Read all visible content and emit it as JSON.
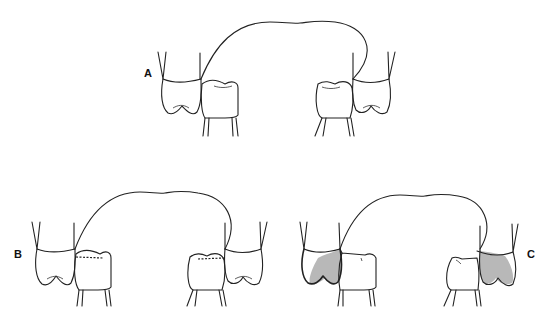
{
  "figure": {
    "panels": [
      {
        "id": "A",
        "label": "A",
        "description": "Normal occlusion of molars and premolars along the dental arch"
      },
      {
        "id": "B",
        "label": "B",
        "description": "Occlusion with dashed contact line on premolar marginal ridges"
      },
      {
        "id": "C",
        "label": "C",
        "description": "Occlusion with shaded region on upper molar crowns"
      }
    ],
    "colors": {
      "line": "#222222",
      "shade": "#b8b8b8",
      "background": "#ffffff"
    }
  }
}
